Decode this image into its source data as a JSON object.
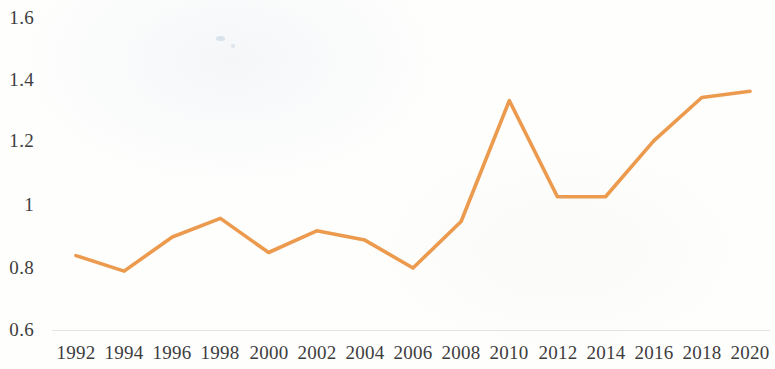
{
  "chart_data": {
    "type": "line",
    "title": "",
    "subtitle": "",
    "xlabel": "",
    "ylabel": "",
    "grid": false,
    "legend": "none",
    "xlim": [
      1992,
      2020
    ],
    "ylim": [
      0.6,
      1.6
    ],
    "x_tick_labels": [
      "1992",
      "1994",
      "1996",
      "1998",
      "2000",
      "2002",
      "2004",
      "2006",
      "2008",
      "2010",
      "2012",
      "2014",
      "2016",
      "2018",
      "2020"
    ],
    "y_tick_labels": [
      "1.6",
      "1.4",
      "1.2",
      "1",
      "0.8",
      "0.6"
    ],
    "y_tick_values": [
      1.6,
      1.4,
      1.2,
      1.0,
      0.8,
      0.6
    ],
    "categories": [
      1992,
      1994,
      1996,
      1998,
      2000,
      2002,
      2004,
      2006,
      2008,
      2010,
      2012,
      2014,
      2016,
      2018,
      2020
    ],
    "series": [
      {
        "name": "Series 1",
        "color": "#EC9A4E",
        "values": [
          0.84,
          0.79,
          0.9,
          0.96,
          0.85,
          0.92,
          0.89,
          0.8,
          0.95,
          1.34,
          1.03,
          1.03,
          1.21,
          1.35,
          1.37
        ]
      }
    ],
    "annotations": []
  },
  "axes": {
    "y_ticks": [
      {
        "label": "1.6",
        "value": 1.6
      },
      {
        "label": "1.4",
        "value": 1.4
      },
      {
        "label": "1.2",
        "value": 1.2
      },
      {
        "label": "1",
        "value": 1.0
      },
      {
        "label": "0.8",
        "value": 0.8
      },
      {
        "label": "0.6",
        "value": 0.6
      }
    ],
    "x_ticks": [
      {
        "label": "1992",
        "value": 1992
      },
      {
        "label": "1994",
        "value": 1994
      },
      {
        "label": "1996",
        "value": 1996
      },
      {
        "label": "1998",
        "value": 1998
      },
      {
        "label": "2000",
        "value": 2000
      },
      {
        "label": "2002",
        "value": 2002
      },
      {
        "label": "2004",
        "value": 2004
      },
      {
        "label": "2006",
        "value": 2006
      },
      {
        "label": "2008",
        "value": 2008
      },
      {
        "label": "2010",
        "value": 2010
      },
      {
        "label": "2012",
        "value": 2012
      },
      {
        "label": "2014",
        "value": 2014
      },
      {
        "label": "2016",
        "value": 2016
      },
      {
        "label": "2018",
        "value": 2018
      },
      {
        "label": "2020",
        "value": 2020
      }
    ]
  },
  "style": {
    "line_color": "#EC9A4E",
    "text_color": "#3d3d3d",
    "baseline_color": "#aaaaaa",
    "background_color": "#fefefd"
  }
}
